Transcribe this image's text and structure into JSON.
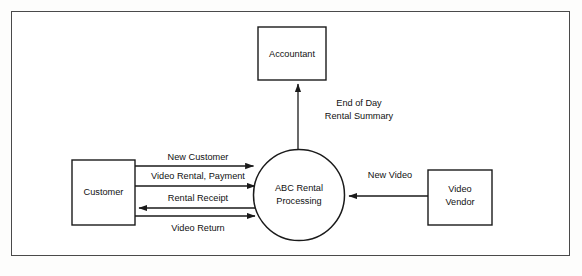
{
  "diagram": {
    "frame": {
      "border_color": "#4a4a4a"
    },
    "colors": {
      "stroke": "#1a1a1a",
      "background": "#ffffff",
      "text": "#111111"
    },
    "entities": [
      {
        "id": "accountant",
        "label": "Accountant",
        "shape": "rectangle"
      },
      {
        "id": "customer",
        "label": "Customer",
        "shape": "rectangle"
      },
      {
        "id": "video-vendor",
        "label_line1": "Video",
        "label_line2": "Vendor",
        "shape": "rectangle"
      }
    ],
    "process": {
      "id": "abc-rental-processing",
      "label_line1": "ABC Rental",
      "label_line2": "Processing",
      "shape": "circle"
    },
    "flows": [
      {
        "id": "end-of-day-rental-summary",
        "label_line1": "End of Day",
        "label_line2": "Rental Summary",
        "from": "abc-rental-processing",
        "to": "accountant",
        "direction": "up"
      },
      {
        "id": "new-customer",
        "label": "New Customer",
        "from": "customer",
        "to": "abc-rental-processing",
        "direction": "right"
      },
      {
        "id": "video-rental-payment",
        "label": "Video Rental, Payment",
        "from": "customer",
        "to": "abc-rental-processing",
        "direction": "right"
      },
      {
        "id": "rental-receipt",
        "label": "Rental   Receipt",
        "from": "abc-rental-processing",
        "to": "customer",
        "direction": "left"
      },
      {
        "id": "video-return",
        "label": "Video Return",
        "from": "customer",
        "to": "abc-rental-processing",
        "direction": "right"
      },
      {
        "id": "new-video",
        "label": "New Video",
        "from": "video-vendor",
        "to": "abc-rental-processing",
        "direction": "left"
      }
    ]
  }
}
